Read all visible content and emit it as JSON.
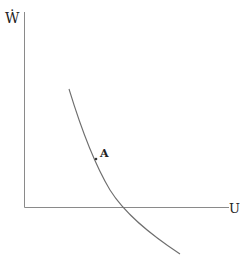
{
  "diagram": {
    "y_axis_label": "Ẇ",
    "x_axis_label": "U",
    "point_label": "A",
    "colors": {
      "axis": "#888888",
      "curve": "#6e6e6e",
      "text": "#222222"
    }
  }
}
